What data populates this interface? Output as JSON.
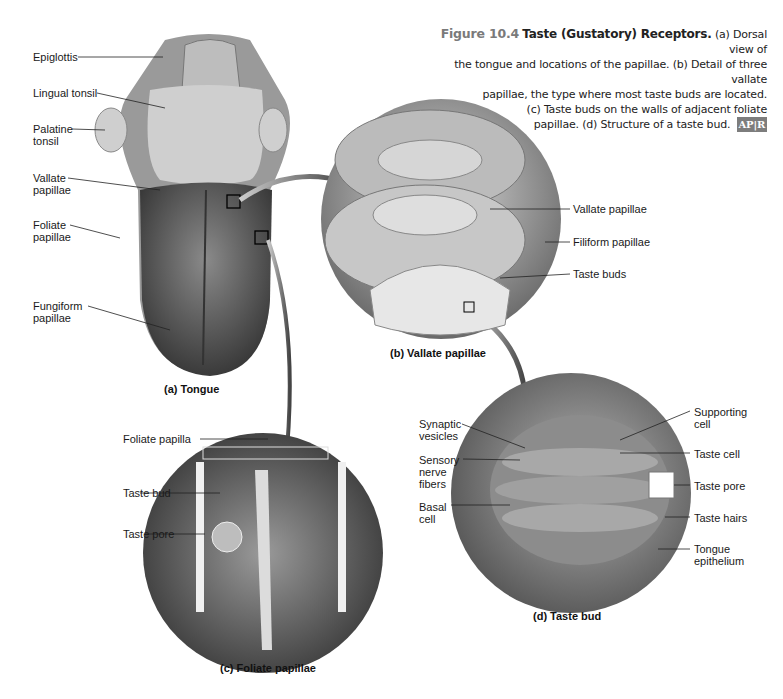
{
  "caption": {
    "figure_number": "Figure 10.4",
    "title": "Taste (Gustatory) Receptors.",
    "line1_rest": " (a) Dorsal view of",
    "line2": "the tongue and locations of the papillae. (b) Detail of three vallate",
    "line3": "papillae, the type where most taste buds are located.",
    "line4": "(c) Taste buds on the walls of adjacent foliate",
    "line5": "papillae. (d) Structure of a taste bud.",
    "badge_ap": "AP",
    "badge_r": "R"
  },
  "panel_a": {
    "title": "(a) Tongue",
    "labels": [
      "Epiglottis",
      "Lingual tonsil",
      "Palatine\ntonsil",
      "Vallate\npapillae",
      "Foliate\npapillae",
      "Fungiform\npapillae"
    ]
  },
  "panel_b": {
    "title": "(b) Vallate papillae",
    "labels": [
      "Vallate papillae",
      "Filiform papillae",
      "Taste buds"
    ]
  },
  "panel_c": {
    "title": "(c) Foliate papillae",
    "labels": [
      "Foliate papilla",
      "Taste bud",
      "Taste pore"
    ]
  },
  "panel_d": {
    "title": "(d) Taste bud",
    "labels_left": [
      "Synaptic\nvesicles",
      "Sensory\nnerve\nfibers",
      "Basal\ncell"
    ],
    "labels_right": [
      "Supporting\ncell",
      "Taste cell",
      "Taste pore",
      "Taste hairs",
      "Tongue\nepithelium"
    ]
  }
}
